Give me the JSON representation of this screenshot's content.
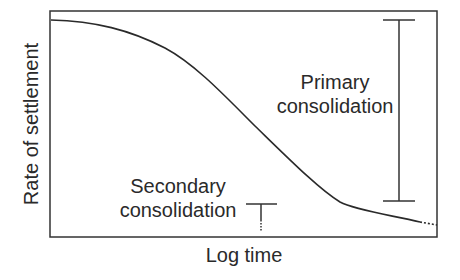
{
  "diagram": {
    "title": "",
    "y_axis_label": "Rate of settlement",
    "x_axis_label": "Log time",
    "annotations": {
      "primary_line1": "Primary",
      "primary_line2": "consolidation",
      "secondary_line1": "Secondary",
      "secondary_line2": "consolidation"
    },
    "colors": {
      "line": "#2a2a2a",
      "background": "#ffffff"
    }
  }
}
